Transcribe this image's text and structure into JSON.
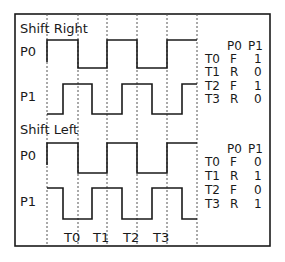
{
  "sections": [
    {
      "title": "Shift Right",
      "signals": [
        {
          "name": "P0",
          "phase": "starts-high-at-T0-boundary"
        },
        {
          "name": "P1",
          "phase": "rises-mid-between"
        }
      ],
      "table": {
        "headers": [
          "P0",
          "P1"
        ],
        "rows": [
          {
            "t": "T0",
            "p0": "F",
            "p1": "1"
          },
          {
            "t": "T1",
            "p0": "R",
            "p1": "0"
          },
          {
            "t": "T2",
            "p0": "F",
            "p1": "1"
          },
          {
            "t": "T3",
            "p0": "R",
            "p1": "0"
          }
        ]
      }
    },
    {
      "title": "Shift Left",
      "signals": [
        {
          "name": "P0",
          "phase": "starts-high-at-T0-boundary"
        },
        {
          "name": "P1",
          "phase": "falls-mid-between"
        }
      ],
      "table": {
        "headers": [
          "P0",
          "P1"
        ],
        "rows": [
          {
            "t": "T0",
            "p0": "F",
            "p1": "0"
          },
          {
            "t": "T1",
            "p0": "R",
            "p1": "1"
          },
          {
            "t": "T2",
            "p0": "F",
            "p1": "0"
          },
          {
            "t": "T3",
            "p0": "R",
            "p1": "1"
          }
        ]
      }
    }
  ],
  "time_labels": [
    "T0",
    "T1",
    "T2",
    "T3"
  ],
  "colors": {
    "line": "#1a1a1a",
    "grid": "#555555",
    "background": "#ffffff"
  }
}
